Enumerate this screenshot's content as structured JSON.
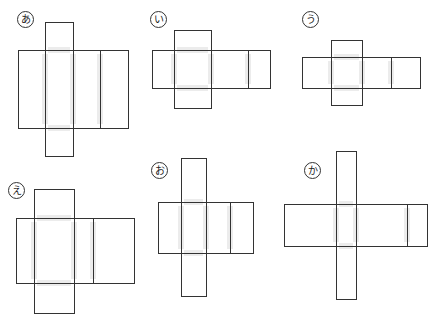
{
  "nets": [
    {
      "label": "あ",
      "label_pos": [
        17,
        11
      ],
      "top_flap": [
        45,
        22,
        28,
        28
      ],
      "main": [
        18,
        50,
        110,
        78
      ],
      "dividers": [
        45,
        73,
        100
      ],
      "bottom_flap": [
        45,
        128,
        28,
        28
      ]
    },
    {
      "label": "い",
      "label_pos": [
        150,
        11
      ],
      "top_flap": [
        174,
        30,
        37,
        20
      ],
      "main": [
        152,
        50,
        118,
        38
      ],
      "dividers": [
        174,
        211,
        248
      ],
      "bottom_flap": [
        174,
        88,
        37,
        20
      ]
    },
    {
      "label": "う",
      "label_pos": [
        302,
        11
      ],
      "top_flap": [
        331,
        40,
        31,
        17
      ],
      "main": [
        302,
        57,
        118,
        31
      ],
      "dividers": [
        331,
        362,
        391
      ],
      "bottom_flap": [
        331,
        88,
        31,
        17
      ]
    },
    {
      "label": "え",
      "label_pos": [
        8,
        182
      ],
      "top_flap": [
        34,
        189,
        40,
        29
      ],
      "main": [
        16,
        218,
        118,
        65
      ],
      "dividers": [
        34,
        74,
        93
      ],
      "bottom_flap": [
        34,
        283,
        40,
        30
      ]
    },
    {
      "label": "お",
      "label_pos": [
        151,
        162
      ],
      "top_flap": [
        181,
        158,
        25,
        44
      ],
      "main": [
        158,
        202,
        95,
        51
      ],
      "dividers": [
        181,
        206,
        230
      ],
      "bottom_flap": [
        181,
        253,
        25,
        43
      ]
    },
    {
      "label": "か",
      "label_pos": [
        304,
        162
      ],
      "top_flap": [
        336,
        151,
        20,
        53
      ],
      "main": [
        284,
        204,
        143,
        42
      ],
      "dividers": [
        336,
        356,
        407
      ],
      "bottom_flap": [
        336,
        246,
        20,
        53
      ]
    }
  ],
  "colors": {
    "line": "#333333",
    "fold_shade": "#ececec"
  }
}
